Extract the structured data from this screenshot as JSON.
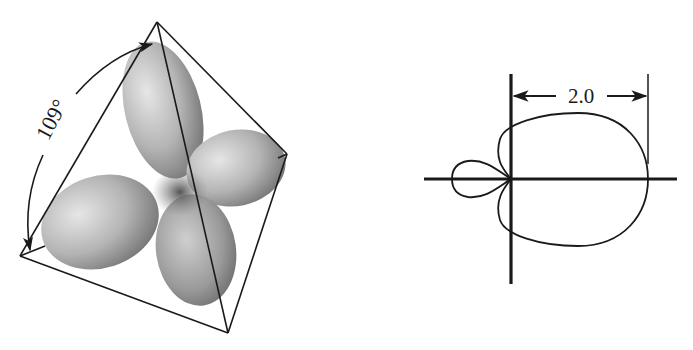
{
  "figure": {
    "background": "#ffffff",
    "ink": "#1a1a1a"
  },
  "tetrahedron_panel": {
    "angle_label": "109°",
    "angle_value_deg": 109,
    "vertices": {
      "top": [
        157,
        22
      ],
      "right": [
        287,
        154
      ],
      "bottom": [
        228,
        333
      ],
      "left": [
        20,
        256
      ]
    },
    "lobe_count": 4,
    "lobe_color_light": "#d4d4d4",
    "lobe_color_dark": "#6e6e6e"
  },
  "polar_panel": {
    "dimension_label": "2.0",
    "dimension_value": 2.0,
    "origin": [
      511,
      179
    ],
    "major_lobe_extent_px": 137,
    "minor_lobe_extent_px": 59
  }
}
